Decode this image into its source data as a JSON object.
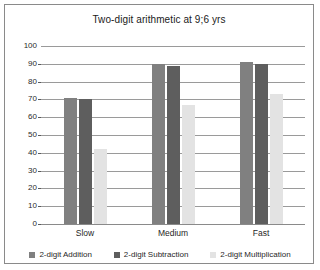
{
  "chart_data": {
    "type": "bar",
    "title": "Two-digit arithmetic at 9;6 yrs",
    "xlabel": "",
    "ylabel": "",
    "ylim": [
      0,
      100
    ],
    "yticks": [
      0,
      10,
      20,
      30,
      40,
      50,
      60,
      70,
      80,
      90,
      100
    ],
    "grid": true,
    "legend_position": "bottom",
    "categories": [
      "Slow",
      "Medium",
      "Fast"
    ],
    "series": [
      {
        "name": "2-digit Addition",
        "color": "#808080",
        "values": [
          71,
          90,
          91
        ]
      },
      {
        "name": "2-digit Subtraction",
        "color": "#5e5e5e",
        "values": [
          70,
          89,
          90
        ]
      },
      {
        "name": "2-digit Multiplication",
        "color": "#e3e3e3",
        "values": [
          42,
          67,
          73
        ]
      }
    ]
  },
  "colors": {
    "frame": "#8a8a8a",
    "gridline": "#9a9a9a",
    "background": "#ffffff",
    "text": "#1f1f1f"
  }
}
